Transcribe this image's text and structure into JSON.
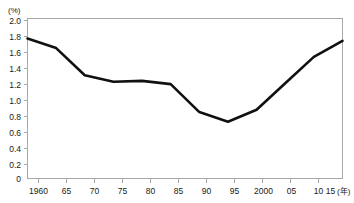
{
  "chart_data": {
    "type": "line",
    "title": "",
    "subtitle": "",
    "xlabel": "(年)",
    "ylabel": "(%)",
    "unit_label": "(%)",
    "xlim": [
      1960,
      2015
    ],
    "ylim": [
      0,
      2.0
    ],
    "grid": false,
    "legend": null,
    "x": [
      1960,
      1965,
      1970,
      1975,
      1980,
      1985,
      1990,
      1995,
      2000,
      2005,
      2010,
      2015
    ],
    "xtick_labels": [
      "1960",
      "65",
      "70",
      "75",
      "80",
      "85",
      "90",
      "95",
      "2000",
      "05",
      "10",
      "15"
    ],
    "ytick_values": [
      2.0,
      1.8,
      1.6,
      1.4,
      1.2,
      1.0,
      0.8,
      0.6,
      0.4,
      0.2,
      0
    ],
    "ytick_labels": [
      "2.0",
      "1.8",
      "1.6",
      "1.4",
      "1.2",
      "1.0",
      "0.8",
      "0.6",
      "0.4",
      "0.2",
      "0"
    ],
    "series": [
      {
        "name": "",
        "values": [
          1.75,
          1.63,
          1.29,
          1.21,
          1.22,
          1.18,
          0.83,
          0.71,
          0.86,
          1.19,
          1.52,
          1.72
        ],
        "color": "#111111"
      }
    ]
  },
  "figure": {
    "axis_color": "#a8a8a8",
    "text_color": "#1a1a1a",
    "background": "#ffffff"
  }
}
